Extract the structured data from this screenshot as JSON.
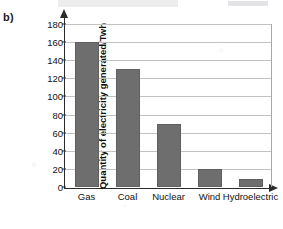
{
  "panel": {
    "label": "b)"
  },
  "chart_data": {
    "type": "bar",
    "title": "",
    "xlabel": "",
    "ylabel": "Quantity of electricity generated/Twh",
    "categories": [
      "Gas",
      "Coal",
      "Nuclear",
      "Wind",
      "Hydroelectric"
    ],
    "values": [
      160,
      130,
      70,
      20,
      9
    ],
    "ylim": [
      0,
      180
    ],
    "yticks": [
      0,
      20,
      40,
      60,
      80,
      100,
      120,
      140,
      160,
      180
    ],
    "ytick_labels": [
      "0",
      "20",
      "40",
      "60",
      "80",
      "100",
      "120",
      "140",
      "160",
      "180"
    ],
    "grid": true,
    "legend": "none",
    "bar_color": "#6e6e6e",
    "axis_color": "#2b2b2b",
    "gridline_color": "#c2c2c2"
  }
}
